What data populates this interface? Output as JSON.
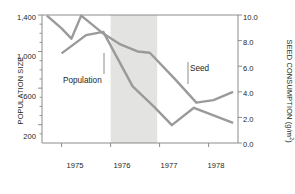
{
  "chart_data": {
    "type": "line",
    "title": "",
    "xlabel": "",
    "ylabel": "POPULATION SIZE",
    "y2label": "SEED CONSUMPTION (g/m",
    "y2label_sup": "2",
    "y2label_tail": ")",
    "xlim": [
      1974.6,
      1978.6
    ],
    "ylim": [
      0,
      1400
    ],
    "y2lim": [
      0.0,
      10.0
    ],
    "grid": false,
    "legend_position": "inline-annotations",
    "x_ticks": [
      "1975",
      "1976",
      "1977",
      "1978"
    ],
    "x_tick_values": [
      1975,
      1976,
      1977,
      1978
    ],
    "y_ticks": [
      "1,400",
      "1,000",
      "600",
      "200"
    ],
    "y_tick_values": [
      1400,
      1000,
      600,
      200
    ],
    "y_minor_values": [
      1300,
      1200,
      1100,
      900,
      800,
      700,
      500,
      400,
      300,
      100
    ],
    "y2_ticks": [
      "10.0",
      "8.0",
      "6.0",
      "4.0",
      "2.0",
      "0.0"
    ],
    "y2_tick_values": [
      10.0,
      8.0,
      6.0,
      4.0,
      2.0,
      0.0
    ],
    "series": [
      {
        "name": "Seed",
        "axis": "right",
        "color": "#9a9a99",
        "x": [
          1974.7,
          1975.0,
          1975.2,
          1975.4,
          1975.85,
          1976.2,
          1976.55,
          1976.8,
          1977.3,
          1977.75,
          1978.1,
          1978.5
        ],
        "values": [
          9.95,
          8.95,
          8.15,
          9.95,
          8.55,
          7.7,
          7.15,
          7.05,
          5.05,
          3.15,
          3.35,
          4.0
        ]
      },
      {
        "name": "Population",
        "axis": "left",
        "color": "#9a9a99",
        "x": [
          1975.0,
          1975.5,
          1975.85,
          1976.45,
          1976.9,
          1977.25,
          1977.7,
          1978.5
        ],
        "values": [
          980,
          1180,
          1215,
          620,
          390,
          195,
          385,
          220
        ]
      }
    ],
    "annotations": [
      {
        "label": "Drought",
        "type": "shaded-band-label"
      },
      {
        "label": "Population",
        "type": "series-callout"
      },
      {
        "label": "Seed",
        "type": "series-callout"
      }
    ],
    "shaded_bands": [
      {
        "label": "Drought",
        "x_start": 1976.0,
        "x_end": 1976.95,
        "color": "#e3e3e2"
      }
    ],
    "colors": {
      "axis": "#808080",
      "text": "#231f20",
      "line": "#9a9a99",
      "band": "#e3e3e2"
    }
  }
}
